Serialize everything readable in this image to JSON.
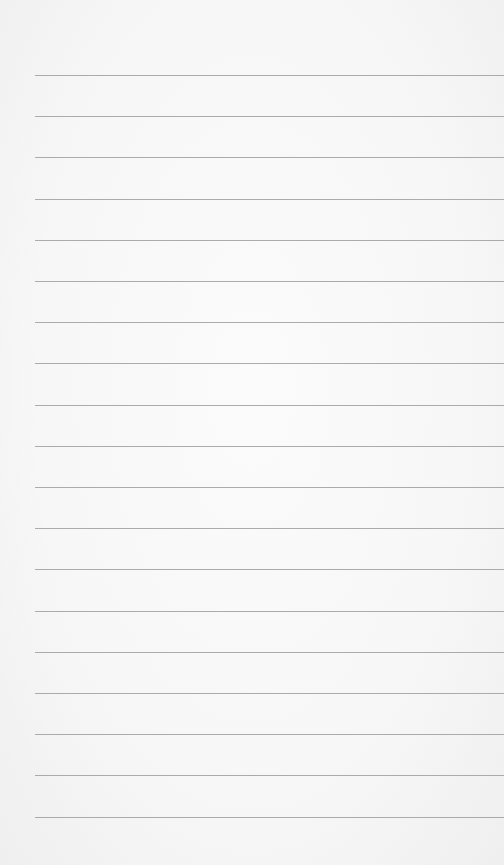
{
  "paper": {
    "background_color": "#f6f6f6",
    "line_color": "#9d9d9d",
    "line_left_px": 35,
    "first_line_y": 75,
    "line_spacing_px": 41.2,
    "line_count": 19
  }
}
